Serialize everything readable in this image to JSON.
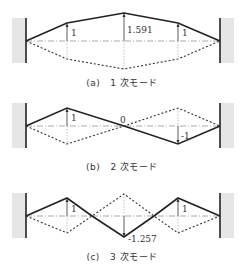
{
  "figure": {
    "panels": [
      {
        "id": "a",
        "caption_label": "(a)",
        "caption_text": "1 次モード",
        "labels": {
          "left": "1",
          "center": "1.591",
          "right": "1"
        }
      },
      {
        "id": "b",
        "caption_label": "(b)",
        "caption_text": "2 次モード",
        "labels": {
          "left": "1",
          "center": "0",
          "right": "-1"
        }
      },
      {
        "id": "c",
        "caption_label": "(c)",
        "caption_text": "3 次モード",
        "labels": {
          "left": "1",
          "center": "-1.257",
          "right": "1"
        }
      }
    ],
    "colors": {
      "wall": "#e6e6e6",
      "line": "#222222"
    }
  }
}
